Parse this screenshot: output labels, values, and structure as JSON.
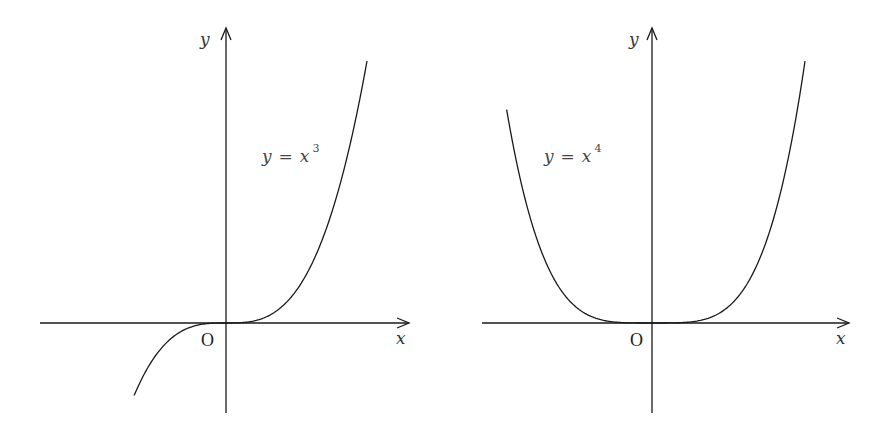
{
  "figure": {
    "panels": [
      {
        "id": "cubic",
        "equation": {
          "lhs": "y",
          "op": "=",
          "base": "x",
          "exponent": "3"
        },
        "x_axis_label": "x",
        "y_axis_label": "y",
        "origin_label": "O",
        "origin_px": [
          226,
          323
        ],
        "x_axis_px": [
          40,
          409
        ],
        "y_axis_px": [
          413,
          28
        ],
        "unit_px": 141,
        "y_scale_px": 262,
        "x_range": [
          -0.652,
          1.0
        ],
        "power": 3
      },
      {
        "id": "quartic",
        "equation": {
          "lhs": "y",
          "op": "=",
          "base": "x",
          "exponent": "4"
        },
        "x_axis_label": "x",
        "y_axis_label": "y",
        "origin_label": "O",
        "origin_px": [
          652,
          323
        ],
        "x_axis_px": [
          482,
          849
        ],
        "y_axis_px": [
          413,
          28
        ],
        "unit_px": 153,
        "y_scale_px": 262,
        "x_range": [
          -0.95,
          1.0
        ],
        "power": 4
      }
    ]
  },
  "chart_data": [
    {
      "type": "line",
      "title": "y = x^3",
      "xlabel": "x",
      "ylabel": "y",
      "origin_label": "O",
      "grid": false,
      "series": [
        {
          "name": "y = x^3",
          "x": [
            -0.65,
            -0.5,
            -0.25,
            0,
            0.25,
            0.5,
            0.75,
            1.0
          ],
          "y": [
            -0.275,
            -0.125,
            -0.016,
            0,
            0.016,
            0.125,
            0.422,
            1.0
          ]
        }
      ]
    },
    {
      "type": "line",
      "title": "y = x^4",
      "xlabel": "x",
      "ylabel": "y",
      "origin_label": "O",
      "grid": false,
      "series": [
        {
          "name": "y = x^4",
          "x": [
            -0.95,
            -0.75,
            -0.5,
            -0.25,
            0,
            0.25,
            0.5,
            0.75,
            1.0
          ],
          "y": [
            0.815,
            0.316,
            0.0625,
            0.0039,
            0,
            0.0039,
            0.0625,
            0.316,
            1.0
          ]
        }
      ]
    }
  ]
}
